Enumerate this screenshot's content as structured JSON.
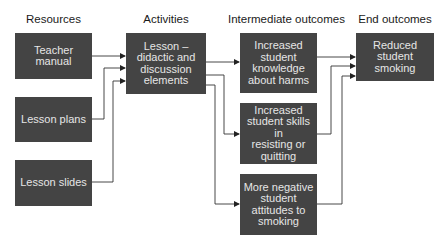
{
  "headers": {
    "resources": "Resources",
    "activities": "Activities",
    "intermediate": "Intermediate outcomes",
    "end": "End outcomes"
  },
  "resources": [
    {
      "label": "Teacher\nmanual"
    },
    {
      "label": "Lesson plans"
    },
    {
      "label": "Lesson slides"
    }
  ],
  "activities": [
    {
      "label": "Lesson –\ndidactic and\ndiscussion\nelements"
    }
  ],
  "intermediate": [
    {
      "label": "Increased\nstudent\nknowledge\nabout harms"
    },
    {
      "label": "Increased\nstudent skills in\nresisting or\nquitting"
    },
    {
      "label": "More negative\nstudent\nattitudes to\nsmoking"
    }
  ],
  "end": [
    {
      "label": "Reduced\nstudent\nsmoking"
    }
  ],
  "edges": [
    [
      "Teacher manual",
      "Lesson"
    ],
    [
      "Lesson plans",
      "Lesson"
    ],
    [
      "Lesson slides",
      "Lesson"
    ],
    [
      "Lesson",
      "Increased student knowledge about harms"
    ],
    [
      "Lesson",
      "Increased student skills in resisting or quitting"
    ],
    [
      "Lesson",
      "More negative student attitudes to smoking"
    ],
    [
      "Increased student knowledge about harms",
      "Reduced student smoking"
    ],
    [
      "Increased student skills in resisting or quitting",
      "Reduced student smoking"
    ],
    [
      "More negative student attitudes to smoking",
      "Reduced student smoking"
    ]
  ],
  "colors": {
    "box_fill": "#444444",
    "box_text": "#e6e6e6",
    "line": "#333333"
  }
}
